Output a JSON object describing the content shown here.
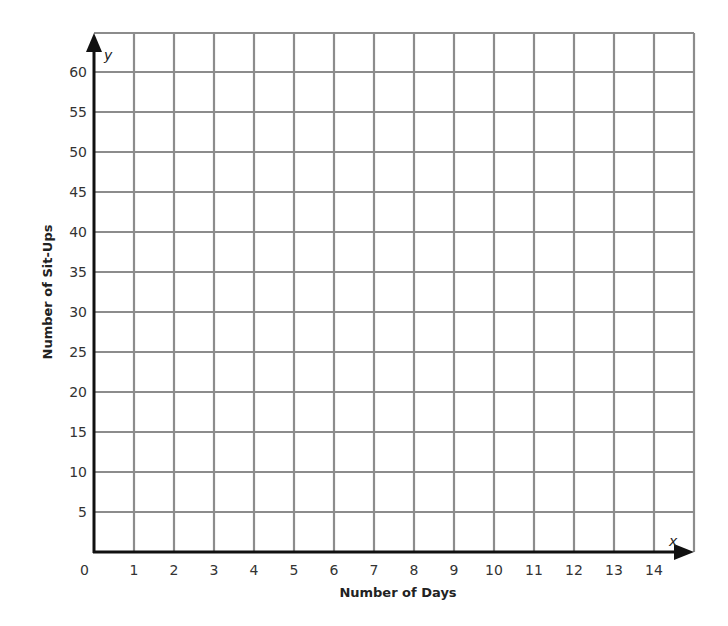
{
  "chart_data": {
    "type": "scatter",
    "title": "",
    "xlabel": "Number of Days",
    "ylabel": "Number of Sit-Ups",
    "x_var": "x",
    "y_var": "y",
    "origin_label": "0",
    "xlim": [
      0,
      15
    ],
    "ylim": [
      0,
      65
    ],
    "x_ticks": [
      1,
      2,
      3,
      4,
      5,
      6,
      7,
      8,
      9,
      10,
      11,
      12,
      13,
      14
    ],
    "y_ticks": [
      5,
      10,
      15,
      20,
      25,
      30,
      35,
      40,
      45,
      50,
      55,
      60
    ],
    "grid": true,
    "series": [],
    "note": "Blank coordinate grid; no data points plotted"
  },
  "colors": {
    "grid": "#8c8c8c",
    "axis": "#111111",
    "background": "#ffffff"
  }
}
